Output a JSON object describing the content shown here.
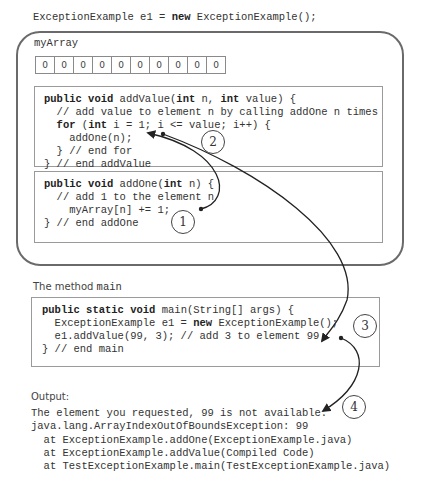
{
  "top_declaration": {
    "before_kw": "ExceptionExample e1 = ",
    "kw": "new",
    "after_kw": " ExceptionExample();"
  },
  "object": {
    "array_label": "myArray",
    "array_values": [
      "0",
      "0",
      "0",
      "0",
      "0",
      "0",
      "0",
      "0",
      "0",
      "0"
    ],
    "add_value_method": {
      "lines": [
        {
          "k1": "public void",
          "t1": " addValue(",
          "k2": "int",
          "t2": " n, ",
          "k3": "int",
          "t3": " value) {"
        },
        {
          "text": "  // add value to element n by calling addOne n times"
        },
        {
          "indent": "  ",
          "k1": "for",
          "t1": " (",
          "k2": "int",
          "t2": " i = 1; i <= value; i++) {"
        },
        {
          "text": "    addOne(n);"
        },
        {
          "text": "  } // end for"
        },
        {
          "text": "} // end addValue"
        }
      ]
    },
    "add_one_method": {
      "lines": [
        {
          "k1": "public void",
          "t1": " addOne(",
          "k2": "int",
          "t2": " n) {"
        },
        {
          "text": "  // add 1 to the element n"
        },
        {
          "text": "    myArray[n] += 1;"
        },
        {
          "text": "} // end addOne"
        }
      ]
    }
  },
  "main_section": {
    "label_prefix": "The method ",
    "label_code": "main",
    "lines": [
      {
        "k1": "public static void",
        "t1": " main(String[] args) {"
      },
      {
        "t0": "  ExceptionExample e1 = ",
        "k1": "new",
        "t1": " ExceptionExample();"
      },
      {
        "text": "  e1.addValue(99, 3); // add 3 to element 99"
      },
      {
        "text": "} // end main"
      }
    ]
  },
  "output_section": {
    "label": "Output:",
    "lines": [
      "The element you requested, 99 is not available.",
      "java.lang.ArrayIndexOutOfBoundsException: 99",
      "  at ExceptionExample.addOne(ExceptionExample.java)",
      "  at ExceptionExample.addValue(Compiled Code)",
      "  at TestExceptionExample.main(TestExceptionExample.java)"
    ]
  },
  "steps": [
    "1",
    "2",
    "3",
    "4"
  ],
  "colors": {
    "frame_border": "#6a6a6a",
    "box_border": "#9a9a9a",
    "arrow": "#222222",
    "text": "#333333"
  }
}
